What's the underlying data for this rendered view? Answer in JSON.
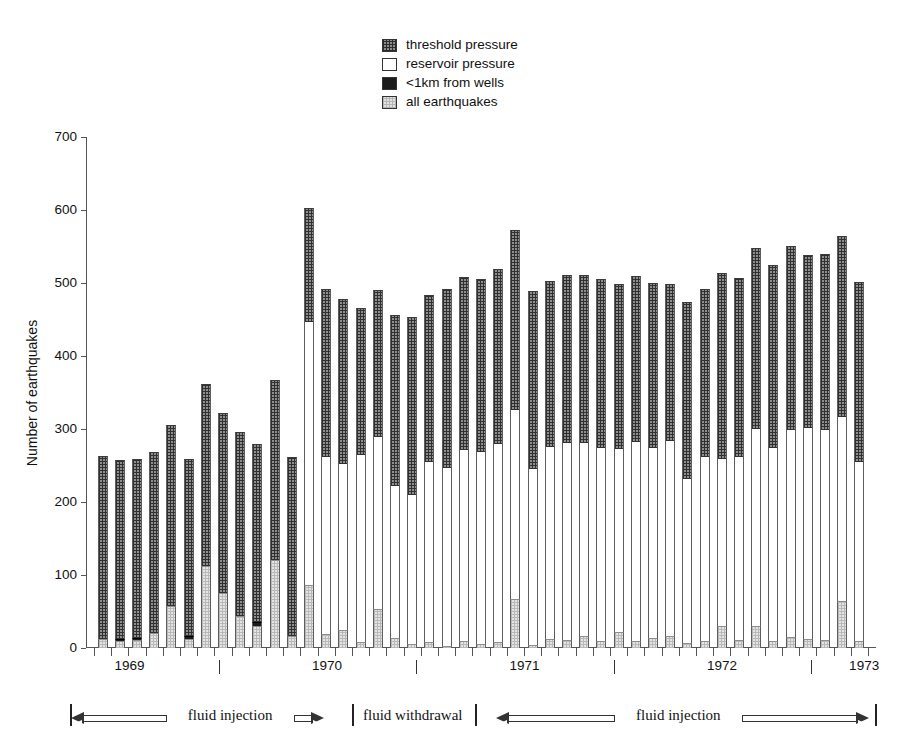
{
  "chart_data": {
    "type": "bar",
    "stacked": true,
    "title": "",
    "xlabel": "",
    "ylabel": "Number of earthquakes",
    "ylim": [
      0,
      700
    ],
    "yticks": [
      0,
      100,
      200,
      300,
      400,
      500,
      600,
      700
    ],
    "grid": false,
    "legend_position": "top-center",
    "legend": [
      {
        "label": "threshold pressure",
        "pattern": "cross-hatch",
        "color": "#8f8f8f"
      },
      {
        "label": "reservoir pressure",
        "pattern": "solid",
        "color": "#ffffff"
      },
      {
        "label": "<1km from wells",
        "pattern": "solid",
        "color": "#1c1c1c"
      },
      {
        "label": "all earthquakes",
        "pattern": "light-dotted",
        "color": "#e4e4e4"
      }
    ],
    "series": [
      {
        "name": "all earthquakes",
        "key": "all"
      },
      {
        "name": "<1km from wells",
        "key": "wells"
      },
      {
        "name": "reservoir pressure",
        "key": "reservoir"
      },
      {
        "name": "threshold pressure",
        "key": "threshold"
      }
    ],
    "x_axis_years": [
      {
        "label": "1969",
        "pos": 0.055
      },
      {
        "label": "1970",
        "pos": 0.305
      },
      {
        "label": "1971",
        "pos": 0.555
      },
      {
        "label": "1972",
        "pos": 0.805
      },
      {
        "label": "1973",
        "pos": 0.985
      }
    ],
    "x_axis_separators": [
      0.168,
      0.418,
      0.668,
      0.918
    ],
    "bars": [
      {
        "all": 12,
        "wells": 0,
        "reservoir": 0,
        "top": 263
      },
      {
        "all": 9,
        "wells": 4,
        "reservoir": 0,
        "top": 258
      },
      {
        "all": 11,
        "wells": 3,
        "reservoir": 0,
        "top": 259
      },
      {
        "all": 20,
        "wells": 0,
        "reservoir": 0,
        "top": 268
      },
      {
        "all": 58,
        "wells": 0,
        "reservoir": 0,
        "top": 305
      },
      {
        "all": 12,
        "wells": 5,
        "reservoir": 0,
        "top": 259
      },
      {
        "all": 112,
        "wells": 0,
        "reservoir": 0,
        "top": 362
      },
      {
        "all": 76,
        "wells": 0,
        "reservoir": 0,
        "top": 322
      },
      {
        "all": 44,
        "wells": 0,
        "reservoir": 0,
        "top": 296
      },
      {
        "all": 30,
        "wells": 6,
        "reservoir": 0,
        "top": 279
      },
      {
        "all": 120,
        "wells": 0,
        "reservoir": 0,
        "top": 367
      },
      {
        "all": 17,
        "wells": 0,
        "reservoir": 0,
        "top": 262
      },
      {
        "all": 86,
        "wells": 0,
        "reservoir": 360,
        "top": 603
      },
      {
        "all": 19,
        "wells": 0,
        "reservoir": 243,
        "top": 492
      },
      {
        "all": 24,
        "wells": 0,
        "reservoir": 228,
        "top": 478
      },
      {
        "all": 8,
        "wells": 0,
        "reservoir": 256,
        "top": 466
      },
      {
        "all": 53,
        "wells": 0,
        "reservoir": 236,
        "top": 490
      },
      {
        "all": 14,
        "wells": 0,
        "reservoir": 208,
        "top": 456
      },
      {
        "all": 5,
        "wells": 0,
        "reservoir": 205,
        "top": 454
      },
      {
        "all": 8,
        "wells": 0,
        "reservoir": 247,
        "top": 484
      },
      {
        "all": 3,
        "wells": 0,
        "reservoir": 243,
        "top": 492
      },
      {
        "all": 10,
        "wells": 0,
        "reservoir": 261,
        "top": 508
      },
      {
        "all": 6,
        "wells": 0,
        "reservoir": 263,
        "top": 506
      },
      {
        "all": 8,
        "wells": 0,
        "reservoir": 272,
        "top": 519
      },
      {
        "all": 67,
        "wells": 0,
        "reservoir": 259,
        "top": 573
      },
      {
        "all": 4,
        "wells": 0,
        "reservoir": 241,
        "top": 489
      },
      {
        "all": 13,
        "wells": 0,
        "reservoir": 263,
        "top": 503
      },
      {
        "all": 11,
        "wells": 0,
        "reservoir": 270,
        "top": 511
      },
      {
        "all": 17,
        "wells": 0,
        "reservoir": 264,
        "top": 511
      },
      {
        "all": 10,
        "wells": 0,
        "reservoir": 264,
        "top": 505
      },
      {
        "all": 22,
        "wells": 0,
        "reservoir": 251,
        "top": 499
      },
      {
        "all": 9,
        "wells": 0,
        "reservoir": 273,
        "top": 509
      },
      {
        "all": 14,
        "wells": 0,
        "reservoir": 260,
        "top": 500
      },
      {
        "all": 17,
        "wells": 0,
        "reservoir": 266,
        "top": 499
      },
      {
        "all": 7,
        "wells": 0,
        "reservoir": 225,
        "top": 474
      },
      {
        "all": 9,
        "wells": 0,
        "reservoir": 252,
        "top": 492
      },
      {
        "all": 30,
        "wells": 0,
        "reservoir": 229,
        "top": 514
      },
      {
        "all": 11,
        "wells": 0,
        "reservoir": 251,
        "top": 507
      },
      {
        "all": 30,
        "wells": 0,
        "reservoir": 270,
        "top": 548
      },
      {
        "all": 10,
        "wells": 0,
        "reservoir": 264,
        "top": 524
      },
      {
        "all": 15,
        "wells": 0,
        "reservoir": 283,
        "top": 551
      },
      {
        "all": 12,
        "wells": 0,
        "reservoir": 289,
        "top": 539
      },
      {
        "all": 11,
        "wells": 0,
        "reservoir": 287,
        "top": 540
      },
      {
        "all": 64,
        "wells": 0,
        "reservoir": 253,
        "top": 565
      },
      {
        "all": 10,
        "wells": 0,
        "reservoir": 245,
        "top": 501
      }
    ]
  },
  "phases": [
    {
      "label": "fluid injection",
      "text_pos": 0.205,
      "arrow_start": 0.013,
      "arrow_end": 0.318,
      "split": 0.205
    },
    {
      "label": "fluid withdrawal",
      "text_pos": 0.425,
      "arrow_start": null,
      "arrow_end": null,
      "split": null
    },
    {
      "label": "fluid injection",
      "text_pos": 0.745,
      "arrow_start": 0.525,
      "arrow_end": 0.975,
      "split": 0.745
    }
  ],
  "phase_ticks": [
    0.012,
    0.352,
    0.5,
    0.982
  ]
}
